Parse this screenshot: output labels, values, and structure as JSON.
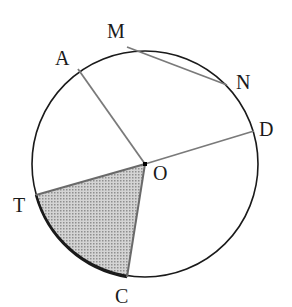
{
  "diagram": {
    "type": "circle-geometry",
    "circle": {
      "center": [
        145,
        164
      ],
      "radius": 113,
      "stroke": "#1a1a1a"
    },
    "points": {
      "O": {
        "label": "O",
        "x": 145,
        "y": 164,
        "label_x": 153,
        "label_y": 180
      },
      "A": {
        "label": "A",
        "x": 78,
        "y": 69,
        "label_x": 55,
        "label_y": 65
      },
      "M": {
        "label": "M",
        "x": 127,
        "y": 47,
        "label_x": 107,
        "label_y": 38
      },
      "N": {
        "label": "N",
        "x": 227,
        "y": 85,
        "label_x": 236,
        "label_y": 89
      },
      "D": {
        "label": "D",
        "x": 254,
        "y": 131,
        "label_x": 259,
        "label_y": 136
      },
      "T": {
        "label": "T",
        "x": 36,
        "y": 195,
        "label_x": 13,
        "label_y": 212
      },
      "C": {
        "label": "C",
        "x": 127,
        "y": 277,
        "label_x": 115,
        "label_y": 303
      }
    },
    "segments": [
      {
        "name": "radius-OA",
        "from": "O",
        "to": "A"
      },
      {
        "name": "radius-OD",
        "from": "O",
        "to": "D"
      },
      {
        "name": "radius-OT",
        "from": "O",
        "to": "T"
      },
      {
        "name": "radius-OC",
        "from": "O",
        "to": "C"
      },
      {
        "name": "chord-MN",
        "from": "M",
        "to": "N"
      }
    ],
    "shaded_sector": {
      "name": "sector-TOC",
      "from": "T",
      "to": "C",
      "center": "O",
      "fill": "#b8b8b8"
    },
    "line_color": "#7a7a7a"
  }
}
